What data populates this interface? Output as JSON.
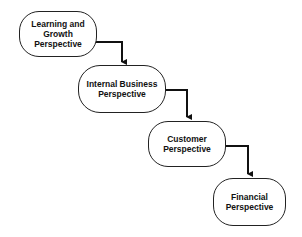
{
  "diagram": {
    "type": "staircase-flow",
    "nodes": [
      {
        "id": "learning",
        "label": "Learning and\nGrowth\nPerspective"
      },
      {
        "id": "internal",
        "label": "Internal Business\nPerspective"
      },
      {
        "id": "customer",
        "label": "Customer\nPerspective"
      },
      {
        "id": "financial",
        "label": "Financial\nPerspective"
      }
    ],
    "edges": [
      {
        "from": "learning",
        "to": "internal"
      },
      {
        "from": "internal",
        "to": "customer"
      },
      {
        "from": "customer",
        "to": "financial"
      }
    ],
    "colors": {
      "stroke": "#111111",
      "fill": "#ffffff",
      "text": "#111111"
    }
  }
}
